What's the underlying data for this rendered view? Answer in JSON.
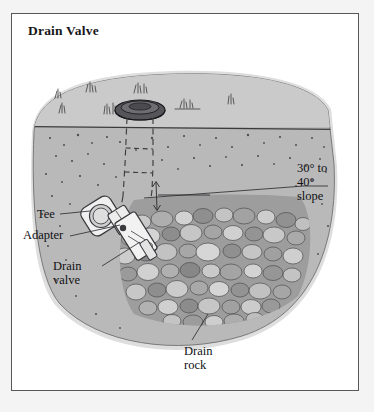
{
  "figure": {
    "title": "Drain Valve",
    "kind": "cross-section-illustration"
  },
  "labels": {
    "tee": "Tee",
    "adapter": "Adapter",
    "drain_valve": "Drain\nvalve",
    "slope": "30° to\n40°\nslope",
    "drain_rock": "Drain\nrock"
  },
  "colors": {
    "page": "#f4f4f4",
    "frame_border": "#58585a",
    "frame_fill": "#ffffff",
    "mound_cap": "#c8c8c8",
    "soil": "#b5b5b5",
    "soil_light": "#d2d2d2",
    "liner": "#101010",
    "rock_light": "#cfcfcf",
    "rock_mid": "#a8a8a8",
    "rock_dark": "#7e7e7e",
    "ink": "#2b2b2e",
    "valve_body": "#efefef",
    "text": "#111114"
  },
  "components": {
    "valve_box_lid": "valve-box-lid",
    "riser_pipe": "dashed-riser-pipe",
    "tee_fitting": "tee-fitting",
    "adapter_fitting": "adapter-fitting",
    "drain_valve_body": "drain-valve-body",
    "liner_band": "impermeable-liner",
    "rock_bed": "drain-rock-bed",
    "slope_arrow": "slope-indicator-arrow",
    "grade_line": "ground-grade-line"
  }
}
